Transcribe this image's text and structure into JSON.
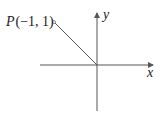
{
  "diagram": {
    "point": {
      "name": "P",
      "coords": "(−1, 1)",
      "x": -1,
      "y": 1
    },
    "axes": {
      "x_label": "x",
      "y_label": "y"
    },
    "segment": "line from P to origin",
    "colors": {
      "line": "#555555",
      "text": "#222222"
    }
  }
}
